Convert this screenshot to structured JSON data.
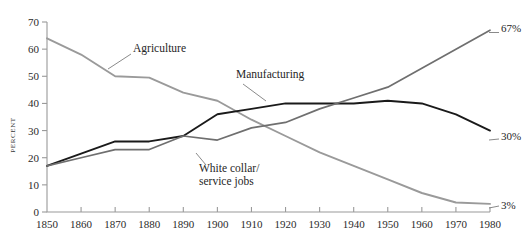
{
  "chart_data": {
    "type": "line",
    "title": "",
    "subtitle": "",
    "xlabel": "",
    "ylabel": "PERCENT",
    "xlim": [
      1850,
      1980
    ],
    "ylim": [
      0,
      70
    ],
    "grid": false,
    "legend_position": "inline-annotations",
    "x": [
      1850,
      1860,
      1870,
      1880,
      1890,
      1900,
      1910,
      1920,
      1930,
      1940,
      1950,
      1960,
      1970,
      1980
    ],
    "xtick_labels": [
      "1850",
      "1860",
      "1870",
      "1880",
      "1890",
      "1900",
      "1910",
      "1920",
      "1930",
      "1940",
      "1950",
      "1960",
      "1970",
      "1980"
    ],
    "ytick_labels": [
      "0",
      "10",
      "20",
      "30",
      "40",
      "50",
      "60",
      "70"
    ],
    "ytick_values": [
      0,
      10,
      20,
      30,
      40,
      50,
      60,
      70
    ],
    "series": [
      {
        "name": "Agriculture",
        "color": "#9a9a9a",
        "width": 1.9,
        "values": [
          64,
          58,
          50,
          49.5,
          44,
          41,
          34,
          28,
          22,
          17,
          12,
          7,
          3.5,
          3
        ],
        "end_label": "3%"
      },
      {
        "name": "Manufacturing",
        "color": "#1a1a1a",
        "width": 1.9,
        "values": [
          17,
          21.5,
          26,
          26,
          28,
          36,
          38,
          40,
          40,
          40,
          41,
          40,
          36,
          30
        ],
        "end_label": "30%"
      },
      {
        "name": "White collar/ service jobs",
        "color": "#6f6f6f",
        "width": 1.7,
        "values": [
          17,
          20,
          23,
          23,
          28,
          26.5,
          31,
          33,
          38,
          42,
          46,
          53,
          60,
          67
        ],
        "end_label": "67%"
      }
    ],
    "annotations": [
      {
        "text": "Agriculture",
        "x": 133,
        "y": 52
      },
      {
        "text": "Manufacturing",
        "x": 236,
        "y": 78
      },
      {
        "text": "White collar/",
        "x": 199,
        "y": 172
      },
      {
        "text": "service jobs",
        "x": 199,
        "y": 185
      }
    ],
    "end_labels": [
      {
        "text": "67%",
        "x": 501,
        "y": 32
      },
      {
        "text": "30%",
        "x": 501,
        "y": 140
      },
      {
        "text": "3%",
        "x": 501,
        "y": 209
      }
    ]
  }
}
